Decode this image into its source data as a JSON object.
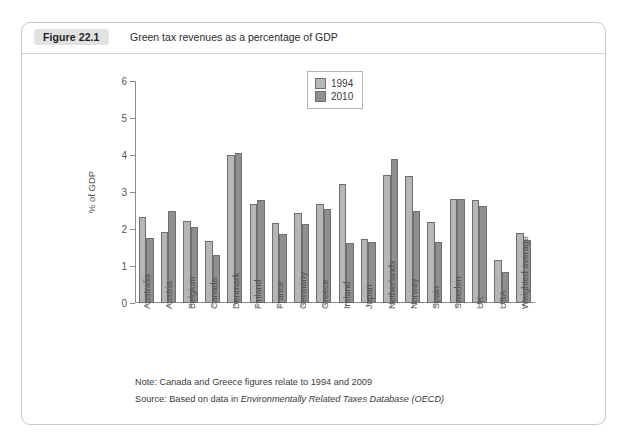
{
  "figure": {
    "badge": "Figure 22.1",
    "title": "Green tax revenues as a percentage of GDP"
  },
  "notes": {
    "note_prefix": "Note: Canada and Greece figures relate to 1994 and 2009",
    "source_prefix": "Source: Based on data in ",
    "source_italic": "Environmentally Related Taxes Database (OECD)"
  },
  "legend": {
    "position": "top-right",
    "items": [
      {
        "label": "1994",
        "color": "#b6b6b6"
      },
      {
        "label": "2010",
        "color": "#8f8f8f"
      }
    ]
  },
  "chart_data": {
    "type": "bar",
    "title": "Green tax revenues as a percentage of GDP",
    "xlabel": "",
    "ylabel": "% of GDP",
    "ylim": [
      0,
      6
    ],
    "yticks": [
      0,
      1,
      2,
      3,
      4,
      5,
      6
    ],
    "grid": false,
    "legend_position": "top-right",
    "categories": [
      "Australia",
      "Austria",
      "Belgium",
      "Canada",
      "Denmark",
      "Finland",
      "France",
      "Germany",
      "Greece",
      "Ireland",
      "Japan",
      "Netherlands",
      "Norway",
      "Spain",
      "Sweden",
      "UK",
      "USA",
      "Weighted average"
    ],
    "series": [
      {
        "name": "1994",
        "color": "#b6b6b6",
        "values": [
          2.32,
          1.92,
          2.21,
          1.68,
          4.01,
          2.68,
          2.16,
          2.44,
          2.67,
          3.21,
          1.72,
          3.45,
          3.43,
          2.18,
          2.82,
          2.78,
          1.15,
          1.9
        ]
      },
      {
        "name": "2010",
        "color": "#8f8f8f",
        "values": [
          1.77,
          2.49,
          2.05,
          1.31,
          4.05,
          2.78,
          1.87,
          2.14,
          2.53,
          1.63,
          1.66,
          3.88,
          2.48,
          1.65,
          2.81,
          2.62,
          0.83,
          1.7
        ]
      }
    ]
  }
}
